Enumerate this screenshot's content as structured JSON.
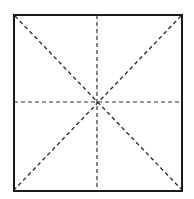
{
  "diagram": {
    "type": "square-with-dashed-guides",
    "square": {
      "x": 13,
      "y": 14,
      "width": 170,
      "height": 178
    },
    "stroke_color": "#1a1a1a",
    "dash_color": "#333333",
    "guides": [
      "vertical-midline",
      "horizontal-midline",
      "diagonal-tl-br",
      "diagonal-tr-bl"
    ]
  }
}
